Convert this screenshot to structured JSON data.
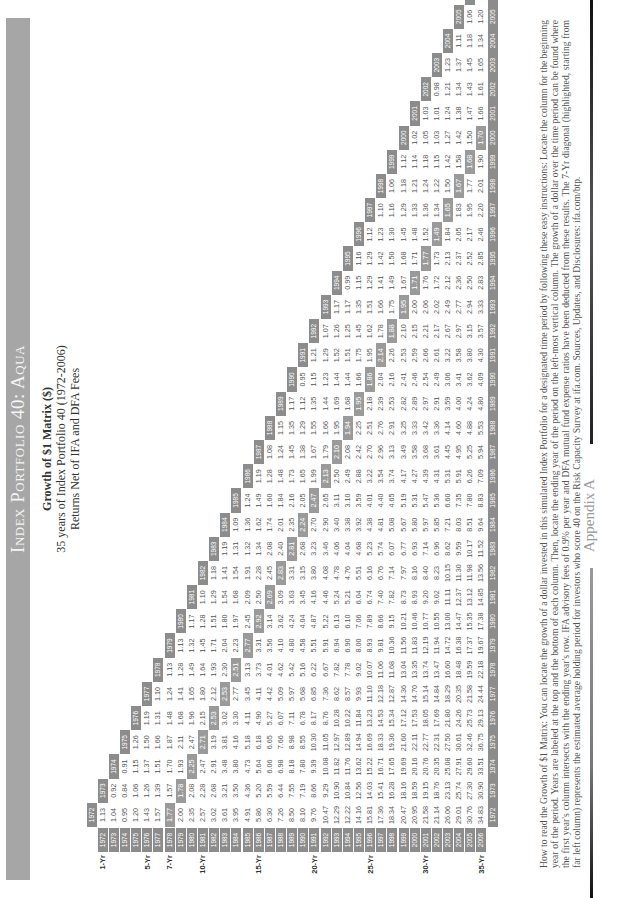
{
  "header": {
    "title": "Index Portfolio 40: Aqua",
    "subtitle": "Growth of $1 Matrix ($)",
    "subtitle2": "35 years of Index Portfolio 40 (1972-2006)",
    "subtitle3": "Returns Net of IFA and DFA Fees"
  },
  "footer": {
    "appendix_label": "Appendix A",
    "how_to_read": "How to read the Growth of $1 Matrix: You can locate the growth of a dollar invested in this simulated Index Portfolio for a designated time period by following these easy instructions: Locate the column for the beginning year of the period. Years are labeled at the top and the bottom of each column. Then, locate the ending year of the period on the left-most vertical column. The growth of a dollar over the time period can be found where the first year's column intersects with the ending year's row. IFA advisory fees of 0.9% per year and DFA mutual fund expense ratios have been deducted from these results. The 7-Yr diagonal (highlighted, starting from far left column) represents the estimated average holding period for investors who score 40 on the Risk Capacity Survey at ifa.com. Sources, Updates, and Disclosures: ifa.com/btp."
  },
  "matrix": {
    "period_labels": {
      "1972": "1-Yr",
      "1976": "5-Yr",
      "1978": "7-Yr",
      "1981": "10-Yr",
      "1986": "15-Yr",
      "1991": "20-Yr",
      "1996": "25-Yr",
      "2001": "30-Yr",
      "2006": "35-Yr"
    },
    "years": [
      "1972",
      "1973",
      "1974",
      "1975",
      "1976",
      "1977",
      "1978",
      "1979",
      "1980",
      "1981",
      "1982",
      "1983",
      "1984",
      "1985",
      "1986",
      "1987",
      "1988",
      "1989",
      "1990",
      "1991",
      "1992",
      "1993",
      "1994",
      "1995",
      "1996",
      "1997",
      "1998",
      "1999",
      "2000",
      "2001",
      "2002",
      "2003",
      "2004",
      "2005",
      "2006"
    ],
    "rows": [
      [
        "1.13"
      ],
      [
        "1.04",
        "0.92"
      ],
      [
        "0.95",
        "0.84",
        "0.91"
      ],
      [
        "1.20",
        "1.06",
        "1.15",
        "1.26"
      ],
      [
        "1.43",
        "1.26",
        "1.37",
        "1.50",
        "1.19"
      ],
      [
        "1.57",
        "1.39",
        "1.51",
        "1.66",
        "1.31",
        "1.10"
      ],
      [
        "1.77",
        "1.57",
        "1.70",
        "1.87",
        "1.48",
        "1.24",
        "1.13"
      ],
      [
        "2.00",
        "1.78",
        "1.93",
        "2.11",
        "1.68",
        "1.41",
        "1.28",
        "1.13"
      ],
      [
        "2.35",
        "2.08",
        "2.25",
        "2.47",
        "1.96",
        "1.65",
        "1.49",
        "1.32",
        "1.17"
      ],
      [
        "2.57",
        "2.28",
        "2.47",
        "2.71",
        "2.15",
        "1.80",
        "1.64",
        "1.45",
        "1.28",
        "1.10"
      ],
      [
        "3.02",
        "2.68",
        "2.91",
        "3.19",
        "2.53",
        "2.12",
        "1.93",
        "1.71",
        "1.51",
        "1.29",
        "1.18"
      ],
      [
        "3.61",
        "3.21",
        "3.48",
        "3.81",
        "3.02",
        "2.53",
        "2.30",
        "2.04",
        "1.80",
        "1.54",
        "1.41",
        "1.19"
      ],
      [
        "3.95",
        "3.50",
        "3.80",
        "4.16",
        "3.30",
        "2.77",
        "2.51",
        "2.23",
        "1.97",
        "1.68",
        "1.54",
        "1.31",
        "1.09"
      ],
      [
        "4.91",
        "4.36",
        "4.73",
        "5.18",
        "4.11",
        "3.45",
        "3.13",
        "2.77",
        "2.45",
        "2.09",
        "1.91",
        "1.32",
        "1.36",
        "1.24"
      ],
      [
        "5.86",
        "5.20",
        "5.64",
        "6.18",
        "4.90",
        "4.11",
        "3.73",
        "3.31",
        "2.92",
        "2.50",
        "2.28",
        "1.34",
        "1.62",
        "1.49",
        "1.19"
      ],
      [
        "6.30",
        "5.59",
        "6.06",
        "6.65",
        "5.27",
        "4.42",
        "4.01",
        "3.56",
        "3.14",
        "2.69",
        "2.45",
        "2.08",
        "1.74",
        "1.60",
        "1.28",
        "1.08"
      ],
      [
        "7.26",
        "6.44",
        "6.98",
        "7.66",
        "6.07",
        "5.09",
        "4.62",
        "4.10",
        "3.62",
        "3.09",
        "2.83",
        "2.40",
        "2.01",
        "1.84",
        "1.48",
        "1.24",
        "1.15"
      ],
      [
        "8.50",
        "7.55",
        "8.18",
        "8.98",
        "7.11",
        "5.97",
        "5.42",
        "4.80",
        "4.24",
        "3.63",
        "3.31",
        "2.81",
        "2.35",
        "2.16",
        "1.73",
        "1.45",
        "1.35",
        "1.17"
      ],
      [
        "8.10",
        "7.19",
        "7.80",
        "8.55",
        "6.78",
        "5.68",
        "5.16",
        "4.58",
        "4.04",
        "3.45",
        "3.15",
        "2.68",
        "2.24",
        "2.05",
        "1.65",
        "1.38",
        "1.29",
        "1.12",
        "0.95"
      ],
      [
        "9.76",
        "8.66",
        "9.39",
        "10.30",
        "8.17",
        "6.85",
        "6.22",
        "5.51",
        "4.87",
        "4.16",
        "3.80",
        "3.23",
        "2.70",
        "2.47",
        "1.99",
        "1.67",
        "1.55",
        "1.35",
        "1.15",
        "1.21"
      ],
      [
        "10.47",
        "9.29",
        "10.08",
        "11.05",
        "8.76",
        "7.36",
        "6.67",
        "5.91",
        "5.22",
        "4.46",
        "4.08",
        "3.46",
        "2.90",
        "2.65",
        "2.13",
        "1.79",
        "1.66",
        "1.44",
        "1.23",
        "1.29",
        "1.07"
      ],
      [
        "12.29",
        "10.90",
        "11.82",
        "12.97",
        "10.28",
        "8.62",
        "7.82",
        "6.94",
        "6.13",
        "5.24",
        "4.78",
        "4.06",
        "3.40",
        "3.11",
        "2.50",
        "2.10",
        "1.95",
        "1.69",
        "1.44",
        "1.52",
        "1.26",
        "1.17"
      ],
      [
        "12.22",
        "10.84",
        "11.76",
        "12.89",
        "10.22",
        "8.57",
        "7.78",
        "6.90",
        "6.10",
        "5.21",
        "4.76",
        "4.04",
        "3.38",
        "3.10",
        "2.49",
        "2.08",
        "1.94",
        "1.68",
        "1.44",
        "1.51",
        "1.25",
        "1.17",
        "0.99"
      ],
      [
        "14.16",
        "12.56",
        "13.62",
        "14.94",
        "11.84",
        "9.93",
        "9.02",
        "8.00",
        "7.06",
        "6.04",
        "5.51",
        "4.68",
        "3.92",
        "3.59",
        "2.88",
        "2.42",
        "2.25",
        "1.95",
        "1.66",
        "1.75",
        "1.45",
        "1.35",
        "1.15",
        "1.16"
      ],
      [
        "15.81",
        "14.03",
        "15.22",
        "16.69",
        "13.23",
        "11.10",
        "10.07",
        "8.93",
        "7.89",
        "6.74",
        "6.16",
        "5.23",
        "4.38",
        "4.01",
        "3.22",
        "2.70",
        "2.51",
        "2.18",
        "1.86",
        "1.95",
        "1.62",
        "1.51",
        "1.29",
        "1.29",
        "1.12"
      ],
      [
        "17.36",
        "15.41",
        "16.71",
        "18.33",
        "14.53",
        "12.18",
        "11.06",
        "9.81",
        "8.66",
        "7.40",
        "6.76",
        "5.74",
        "4.81",
        "4.40",
        "3.54",
        "2.96",
        "2.76",
        "2.39",
        "2.04",
        "2.14",
        "1.78",
        "1.66",
        "1.41",
        "1.42",
        "1.23",
        "1.10"
      ],
      [
        "18.34",
        "16.28",
        "17.65",
        "19.36",
        "15.34",
        "12.87",
        "11.68",
        "10.36",
        "9.15",
        "7.82",
        "7.14",
        "6.07",
        "5.08",
        "4.65",
        "3.74",
        "3.13",
        "2.91",
        "2.53",
        "2.16",
        "2.26",
        "1.88",
        "1.75",
        "1.49",
        "1.50",
        "1.30",
        "1.16",
        "1.06"
      ],
      [
        "20.47",
        "18.16",
        "19.69",
        "21.60",
        "17.12",
        "14.36",
        "13.04",
        "11.56",
        "10.21",
        "8.73",
        "7.97",
        "6.77",
        "5.67",
        "5.19",
        "4.17",
        "3.49",
        "3.25",
        "2.82",
        "2.41",
        "2.53",
        "2.10",
        "1.95",
        "1.67",
        "1.68",
        "1.45",
        "1.29",
        "1.18",
        "1.12"
      ],
      [
        "20.95",
        "18.59",
        "20.16",
        "22.11",
        "17.53",
        "14.70",
        "13.35",
        "11.83",
        "10.46",
        "8.93",
        "8.16",
        "6.93",
        "5.80",
        "5.31",
        "4.27",
        "3.58",
        "3.33",
        "2.89",
        "2.46",
        "2.59",
        "2.15",
        "2.00",
        "1.71",
        "1.71",
        "1.48",
        "1.33",
        "1.21",
        "1.14",
        "1.02"
      ],
      [
        "21.58",
        "19.15",
        "20.76",
        "22.77",
        "18.05",
        "15.14",
        "13.74",
        "12.19",
        "10.77",
        "9.20",
        "8.40",
        "7.14",
        "5.97",
        "5.47",
        "4.39",
        "3.68",
        "3.42",
        "2.97",
        "2.54",
        "2.66",
        "2.21",
        "2.06",
        "1.76",
        "1.77",
        "1.52",
        "1.36",
        "1.24",
        "1.18",
        "1.05",
        "1.03"
      ],
      [
        "21.14",
        "18.76",
        "20.35",
        "22.31",
        "17.69",
        "14.84",
        "13.47",
        "11.94",
        "10.55",
        "9.02",
        "8.23",
        "6.96",
        "5.85",
        "5.36",
        "4.31",
        "3.61",
        "3.36",
        "2.91",
        "2.49",
        "2.61",
        "2.17",
        "2.02",
        "1.72",
        "1.73",
        "1.49",
        "1.34",
        "1.22",
        "1.15",
        "1.03",
        "1.01",
        "0.98"
      ],
      [
        "26.06",
        "23.13",
        "25.08",
        "27.50",
        "21.80",
        "18.29",
        "16.60",
        "14.72",
        "13.00",
        "11.11",
        "10.15",
        "8.62",
        "7.21",
        "6.60",
        "5.31",
        "4.45",
        "4.14",
        "3.59",
        "3.06",
        "3.22",
        "2.67",
        "2.49",
        "2.12",
        "2.13",
        "1.84",
        "1.65",
        "1.50",
        "1.42",
        "1.27",
        "1.24",
        "1.21",
        "1.23"
      ],
      [
        "29.01",
        "25.74",
        "27.91",
        "30.61",
        "24.26",
        "20.35",
        "18.48",
        "16.38",
        "14.47",
        "12.37",
        "11.30",
        "9.59",
        "8.03",
        "7.35",
        "5.91",
        "4.95",
        "4.60",
        "4.00",
        "3.41",
        "3.58",
        "2.97",
        "2.77",
        "2.36",
        "2.37",
        "2.05",
        "1.83",
        "1.67",
        "1.58",
        "1.42",
        "1.38",
        "1.34",
        "1.37",
        "1.11"
      ],
      [
        "30.76",
        "27.30",
        "29.60",
        "32.46",
        "25.73",
        "21.58",
        "19.59",
        "17.37",
        "15.35",
        "13.12",
        "11.98",
        "10.17",
        "8.51",
        "7.80",
        "6.26",
        "5.25",
        "4.88",
        "4.24",
        "3.62",
        "3.80",
        "3.15",
        "2.94",
        "2.50",
        "2.52",
        "2.17",
        "1.95",
        "1.77",
        "1.68",
        "1.50",
        "1.47",
        "1.43",
        "1.45",
        "1.18",
        "1.06"
      ],
      [
        "34.83",
        "30.90",
        "33.51",
        "36.75",
        "29.13",
        "24.44",
        "22.18",
        "19.67",
        "17.38",
        "14.85",
        "13.56",
        "11.52",
        "9.64",
        "8.83",
        "7.09",
        "5.94",
        "5.53",
        "4.80",
        "4.09",
        "4.30",
        "3.57",
        "3.33",
        "2.83",
        "2.85",
        "2.46",
        "2.20",
        "2.01",
        "1.90",
        "1.70",
        "1.66",
        "1.61",
        "1.65",
        "1.34",
        "1.20",
        "1.13"
      ]
    ],
    "highlight_diagonal_offset": 6
  },
  "colors": {
    "title_band": "#a6a6a6",
    "year_label_bg": "#8c8c8c",
    "highlight_bg": "#9a9a9a",
    "text": "#555555"
  }
}
